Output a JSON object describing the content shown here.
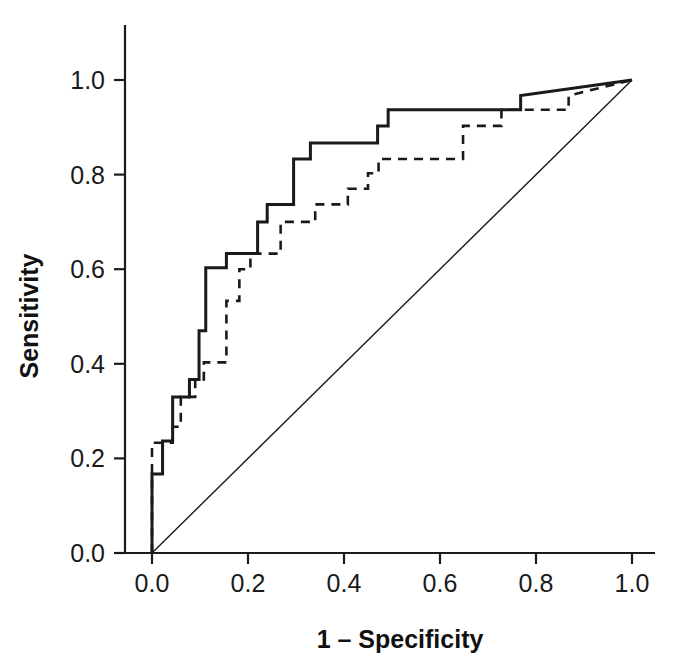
{
  "chart_data": {
    "type": "line",
    "title": "",
    "subtitle": "",
    "xlabel": "1 – Specificity",
    "ylabel": "Sensitivity",
    "xlim": [
      0.0,
      1.0
    ],
    "ylim": [
      0.0,
      1.0
    ],
    "grid": false,
    "legend": "none",
    "x_ticks": [
      0.0,
      0.2,
      0.4,
      0.6,
      0.8,
      1.0
    ],
    "y_ticks": [
      0.0,
      0.2,
      0.4,
      0.6,
      0.8,
      1.0
    ],
    "x_tick_labels": [
      "0.0",
      "0.2",
      "0.4",
      "0.6",
      "0.8",
      "1.0"
    ],
    "y_tick_labels": [
      "0.0",
      "0.2",
      "0.4",
      "0.6",
      "0.8",
      "1.0"
    ],
    "series": [
      {
        "name": "ROC curve 1 (solid)",
        "style": "solid",
        "color": "#1a1a1a",
        "width": 3.0,
        "points": [
          [
            0.0,
            0.0
          ],
          [
            0.0,
            0.167
          ],
          [
            0.022,
            0.167
          ],
          [
            0.022,
            0.237
          ],
          [
            0.043,
            0.237
          ],
          [
            0.043,
            0.33
          ],
          [
            0.078,
            0.33
          ],
          [
            0.078,
            0.367
          ],
          [
            0.098,
            0.367
          ],
          [
            0.098,
            0.47
          ],
          [
            0.112,
            0.47
          ],
          [
            0.112,
            0.603
          ],
          [
            0.155,
            0.603
          ],
          [
            0.155,
            0.633
          ],
          [
            0.22,
            0.633
          ],
          [
            0.22,
            0.7
          ],
          [
            0.24,
            0.7
          ],
          [
            0.24,
            0.737
          ],
          [
            0.295,
            0.737
          ],
          [
            0.295,
            0.833
          ],
          [
            0.33,
            0.833
          ],
          [
            0.33,
            0.867
          ],
          [
            0.47,
            0.867
          ],
          [
            0.47,
            0.903
          ],
          [
            0.492,
            0.903
          ],
          [
            0.492,
            0.937
          ],
          [
            0.768,
            0.937
          ],
          [
            0.768,
            0.967
          ],
          [
            1.0,
            1.0
          ]
        ]
      },
      {
        "name": "ROC curve 2 (dashed)",
        "style": "dashed",
        "color": "#1a1a1a",
        "width": 2.6,
        "dash": "9,7",
        "points": [
          [
            0.0,
            0.0
          ],
          [
            0.0,
            0.233
          ],
          [
            0.043,
            0.233
          ],
          [
            0.043,
            0.267
          ],
          [
            0.06,
            0.267
          ],
          [
            0.06,
            0.33
          ],
          [
            0.09,
            0.33
          ],
          [
            0.09,
            0.367
          ],
          [
            0.108,
            0.367
          ],
          [
            0.108,
            0.403
          ],
          [
            0.155,
            0.403
          ],
          [
            0.155,
            0.533
          ],
          [
            0.182,
            0.533
          ],
          [
            0.182,
            0.6
          ],
          [
            0.205,
            0.6
          ],
          [
            0.205,
            0.633
          ],
          [
            0.268,
            0.633
          ],
          [
            0.268,
            0.7
          ],
          [
            0.34,
            0.7
          ],
          [
            0.34,
            0.737
          ],
          [
            0.408,
            0.737
          ],
          [
            0.408,
            0.77
          ],
          [
            0.45,
            0.77
          ],
          [
            0.45,
            0.803
          ],
          [
            0.472,
            0.803
          ],
          [
            0.472,
            0.833
          ],
          [
            0.648,
            0.833
          ],
          [
            0.648,
            0.903
          ],
          [
            0.728,
            0.903
          ],
          [
            0.728,
            0.937
          ],
          [
            0.868,
            0.937
          ],
          [
            0.868,
            0.967
          ],
          [
            1.0,
            1.0
          ]
        ]
      },
      {
        "name": "Reference diagonal",
        "style": "solid",
        "color": "#1a1a1a",
        "width": 1.4,
        "points": [
          [
            0.0,
            0.0
          ],
          [
            1.0,
            1.0
          ]
        ]
      }
    ]
  }
}
